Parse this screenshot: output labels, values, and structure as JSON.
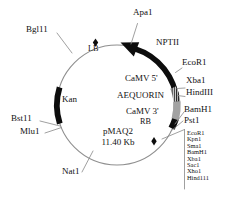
{
  "figure": {
    "type": "plasmid-map",
    "plasmid_name": "pMAQ2",
    "plasmid_size": "11.40 Kb",
    "circle": {
      "cx": 117,
      "cy": 105,
      "r": 60
    }
  },
  "features": [
    {
      "id": "nptii",
      "label": "NPTII",
      "style": "black-arrow",
      "start_deg": 300,
      "end_deg": 357,
      "direction": "counterclockwise"
    },
    {
      "id": "camv5",
      "label": "CaMV 5'",
      "style": "hatched",
      "start_deg": 357,
      "end_deg": 13
    },
    {
      "id": "aequorin",
      "label": "AEQUORIN",
      "style": "gray",
      "start_deg": 13,
      "end_deg": 36
    },
    {
      "id": "camv3",
      "label": "CaMV 3'",
      "style": "black",
      "start_deg": 36,
      "end_deg": 47
    },
    {
      "id": "kan",
      "label": "Kan",
      "style": "black",
      "start_deg": 163,
      "end_deg": 208
    }
  ],
  "markers": [
    {
      "id": "lb",
      "label": "LB",
      "shape": "diamond",
      "angle_deg": 249
    },
    {
      "id": "rb",
      "label": "RB",
      "shape": "diamond",
      "angle_deg": 52
    }
  ],
  "labels": {
    "apa1": "Apa1",
    "bgl11": "Bgl11",
    "lb": "LB",
    "nptii": "NPTII",
    "ecor1_top": "EcoR1",
    "xba1": "Xba1",
    "hindiii": "HindIII",
    "camv5": "CaMV 5'",
    "aequorin": "AEQUORIN",
    "camv3": "CaMV 3'",
    "bamh1": "BamH1",
    "pst1": "Pst1",
    "rb": "RB",
    "kan": "Kan",
    "bst11": "Bst11",
    "mlu1": "Mlu1",
    "nat1": "Nat1",
    "plasmid_name": "pMAQ2",
    "plasmid_size": "11.40 Kb"
  },
  "mcs_sites": [
    "EcoR1",
    "Kpn1",
    "Sma1",
    "BamH1",
    "Xba1",
    "Sac1",
    "Xho1",
    "Hind111"
  ],
  "colors": {
    "background": "#ffffff",
    "backbone": "#8a8a8a",
    "feature_black": "#0d0d0d",
    "feature_gray": "#b3b3b3",
    "leader_line": "#8f8f8f",
    "text": "#111111"
  }
}
